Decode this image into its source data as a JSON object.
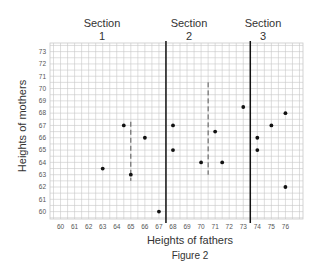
{
  "chart_data": {
    "type": "scatter",
    "title": "Figure 2",
    "xlabel": "Heights of fathers",
    "ylabel": "Heights of mothers",
    "xlim": [
      60,
      76
    ],
    "ylim": [
      60,
      73
    ],
    "x_ticks": [
      60,
      61,
      62,
      63,
      64,
      65,
      66,
      67,
      68,
      69,
      70,
      71,
      72,
      73,
      74,
      75,
      76
    ],
    "y_ticks": [
      60,
      61,
      62,
      63,
      64,
      65,
      66,
      67,
      68,
      69,
      70,
      71,
      72,
      73
    ],
    "grid": true,
    "sections": [
      {
        "label": "Section",
        "number": "1",
        "x_range": [
          60,
          67.5
        ],
        "mean_line_x": 65
      },
      {
        "label": "Section",
        "number": "2",
        "x_range": [
          67.5,
          73.5
        ],
        "mean_line_x": 70.5
      },
      {
        "label": "Section",
        "number": "3",
        "x_range": [
          73.5,
          76.5
        ],
        "mean_line_x": null
      }
    ],
    "section_dividers_x": [
      67.5,
      73.5
    ],
    "points": [
      {
        "x": 64.5,
        "y": 67,
        "section": 1
      },
      {
        "x": 66,
        "y": 66,
        "section": 1
      },
      {
        "x": 63,
        "y": 63.5,
        "section": 1
      },
      {
        "x": 65,
        "y": 63,
        "section": 1
      },
      {
        "x": 67,
        "y": 60,
        "section": 1
      },
      {
        "x": 68,
        "y": 67,
        "section": 2
      },
      {
        "x": 68,
        "y": 65,
        "section": 2
      },
      {
        "x": 71,
        "y": 66.5,
        "section": 2
      },
      {
        "x": 70,
        "y": 64,
        "section": 2
      },
      {
        "x": 71.5,
        "y": 64,
        "section": 2
      },
      {
        "x": 73,
        "y": 68.5,
        "section": 2
      },
      {
        "x": 76,
        "y": 68,
        "section": 3
      },
      {
        "x": 75,
        "y": 67,
        "section": 3
      },
      {
        "x": 74,
        "y": 66,
        "section": 3
      },
      {
        "x": 74,
        "y": 65,
        "section": 3
      },
      {
        "x": 76,
        "y": 62,
        "section": 3
      }
    ]
  },
  "headers": {
    "s1_label": "Section",
    "s1_num": "1",
    "s2_label": "Section",
    "s2_num": "2",
    "s3_label": "Section",
    "s3_num": "3"
  },
  "axes": {
    "xlabel": "Heights of fathers",
    "ylabel": "Heights of mothers"
  },
  "caption": "Figure 2",
  "colors": {
    "grid": "#c8c8c8",
    "divider": "#111111",
    "point": "#111111",
    "mean_line": "#555555"
  }
}
